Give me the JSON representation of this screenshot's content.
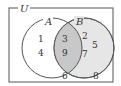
{
  "diagram": {
    "universe_label": "U",
    "set_a_label": "A",
    "set_b_label": "B",
    "a_only": [
      "1",
      "4"
    ],
    "a_and_b": [
      "3",
      "9"
    ],
    "b_only": [
      "2",
      "5",
      "7"
    ],
    "outside": [
      "6",
      "8"
    ],
    "colors": {
      "intersection_fill": "#c8c8c8",
      "b_fill": "#e6e6e6",
      "stroke": "#555555"
    }
  }
}
